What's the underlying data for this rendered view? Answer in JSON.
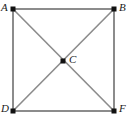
{
  "figure": {
    "kind": "geometry-diagram",
    "background_color": "#ffffff",
    "edge_color": "#8c8c8c",
    "diagonal_color": "#8c8c8c",
    "marker_color": "#111111",
    "label_color": "#1a1a1a",
    "edge_width": 2,
    "diagonal_width": 1.6,
    "marker_size": 5,
    "points": [
      {
        "id": "A",
        "label": "A",
        "x": 13,
        "y": 9,
        "label_x": 1,
        "label_y": 2,
        "label_anchor": "left"
      },
      {
        "id": "B",
        "label": "B",
        "x": 114,
        "y": 9,
        "label_x": 119,
        "label_y": 2,
        "label_anchor": "right"
      },
      {
        "id": "C",
        "label": "C",
        "x": 63,
        "y": 61,
        "label_x": 69,
        "label_y": 54,
        "label_anchor": "right"
      },
      {
        "id": "D",
        "label": "D",
        "x": 13,
        "y": 111,
        "label_x": 1,
        "label_y": 103,
        "label_anchor": "left"
      },
      {
        "id": "F",
        "label": "F",
        "x": 114,
        "y": 111,
        "label_x": 119,
        "label_y": 103,
        "label_anchor": "right"
      }
    ],
    "edges": [
      {
        "id": "AB",
        "from": "A",
        "to": "B",
        "role": "square-side-top"
      },
      {
        "id": "BF",
        "from": "B",
        "to": "F",
        "role": "square-side-right"
      },
      {
        "id": "FD",
        "from": "F",
        "to": "D",
        "role": "square-side-bottom"
      },
      {
        "id": "DA",
        "from": "D",
        "to": "A",
        "role": "square-side-left"
      }
    ],
    "diagonals": [
      {
        "id": "AF",
        "from": "A",
        "to": "F",
        "role": "diagonal"
      },
      {
        "id": "BD",
        "from": "B",
        "to": "D",
        "role": "diagonal"
      }
    ]
  }
}
